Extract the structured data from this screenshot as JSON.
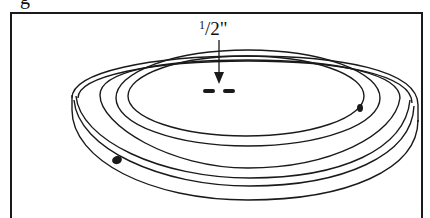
{
  "figure": {
    "title_fragment": "g",
    "dimension": {
      "numerator": "1",
      "separator": "/",
      "denominator": "2",
      "unit": "\"",
      "full": "1/2\""
    },
    "callouts": [
      {
        "name": "center-slot",
        "description": "two short dashes at center of top face"
      },
      {
        "name": "rim-notch-right",
        "description": "dark mark on right rim"
      },
      {
        "name": "rim-notch-left",
        "description": "dark mark on front-left rim groove"
      }
    ],
    "colors": {
      "line": "#1a1a1a",
      "background": "#ffffff"
    }
  }
}
